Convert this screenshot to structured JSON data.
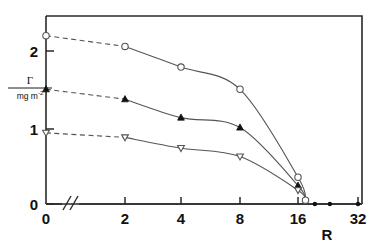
{
  "chart_data": {
    "type": "line",
    "title": "",
    "xlabel": "R",
    "ylabel_numerator": "Γ",
    "ylabel_denominator": "mg m",
    "ylabel_denominator_exponent": "-2",
    "ylabel_full": "Γ / mg m⁻²",
    "xticks": [
      0,
      2,
      4,
      8,
      16,
      32
    ],
    "xticklabels": [
      "0",
      "2",
      "4",
      "8",
      "16",
      "32"
    ],
    "yticks": [
      0,
      1,
      2
    ],
    "yticklabels": [
      "0",
      "1",
      "2"
    ],
    "ylim": [
      0,
      2.62
    ],
    "xlim_note": "broken axis after 0, ticks at equal visual spacing 2,4,8,16,32",
    "axis_break": "//",
    "grid": "off",
    "legend": "none",
    "series": [
      {
        "name": "series-circles",
        "marker": "open-circle",
        "x": [
          0,
          2,
          4,
          8,
          16,
          18
        ],
        "values": [
          2.2,
          2.06,
          1.79,
          1.5,
          0.35,
          0.05
        ],
        "dashed_from_x": 0,
        "dashed_to_x": 2
      },
      {
        "name": "series-filled-triangles",
        "marker": "filled-triangle-up",
        "x": [
          0,
          2,
          4,
          8,
          16,
          18
        ],
        "values": [
          1.5,
          1.37,
          1.13,
          1.0,
          0.24,
          0.05
        ],
        "dashed_from_x": 0,
        "dashed_to_x": 2
      },
      {
        "name": "series-open-down-triangles",
        "marker": "open-triangle-down",
        "x": [
          0,
          2,
          4,
          8,
          16,
          18
        ],
        "values": [
          0.93,
          0.87,
          0.73,
          0.62,
          0.18,
          0.05
        ],
        "dashed_from_x": 0,
        "dashed_to_x": 2
      }
    ],
    "baseline_points": {
      "name": "zero-line-filled-points",
      "marker": "filled-dot",
      "x": [
        20.5,
        24.5,
        32
      ],
      "values": [
        0,
        0,
        0
      ]
    },
    "annotations": []
  },
  "axis": {
    "x_label": "R",
    "y_tick_0": "0",
    "y_tick_1": "1",
    "y_tick_2": "2",
    "x_tick_0": "0",
    "x_tick_2": "2",
    "x_tick_4": "4",
    "x_tick_8": "8",
    "x_tick_16": "16",
    "x_tick_32": "32"
  },
  "colors": {
    "ink": "#1a1a1a",
    "curve": "#555555",
    "background": "#ffffff"
  }
}
